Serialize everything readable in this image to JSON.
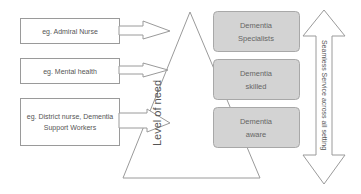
{
  "diagram": {
    "left_boxes": [
      {
        "label": "eg. Admiral Nurse"
      },
      {
        "label": "eg. Mental health"
      },
      {
        "label": "eg. District nurse, Dementia Support Workers"
      }
    ],
    "triangle": {
      "label": "Level of need"
    },
    "levels": [
      {
        "label": "Dementia Specialists"
      },
      {
        "label": "Dementia skilled"
      },
      {
        "label": "Dementia aware"
      }
    ],
    "double_arrow": {
      "label": "Seamless Service across all setting"
    },
    "colors": {
      "stroke": "#9a9a9a",
      "level_fill": "#d3d3d3",
      "level_stroke": "#a8a8a8",
      "text": "#555555"
    }
  }
}
